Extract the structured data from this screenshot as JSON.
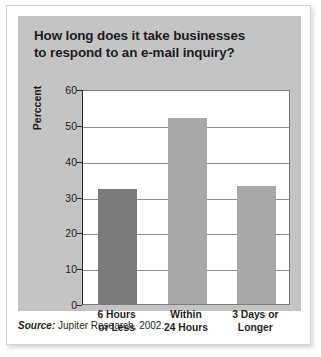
{
  "figure": {
    "title_line1": "How long does it take businesses",
    "title_line2": "to respond to an e-mail inquiry?",
    "source_label": "Source:",
    "source_text": " Jupiter Research, 2002."
  },
  "colors": {
    "panel_background": "#c4c4c4",
    "plot_background": "#ffffff",
    "card_background": "#ffffff",
    "gridline": "#8e8e8e",
    "axis": "#2b2b2b",
    "text": "#1f1f1f",
    "bar_dark": "#7b7b7b",
    "bar_light": "#a8a8a8"
  },
  "chart_data": {
    "type": "bar",
    "title": "How long does it take businesses to respond to an e-mail inquiry?",
    "xlabel": "",
    "ylabel": "Perccent",
    "categories": [
      "6 Hours or Less",
      "Within 24 Hours",
      "3 Days or Longer"
    ],
    "category_lines": [
      [
        "6 Hours",
        "or Less"
      ],
      [
        "Within",
        "24 Hours"
      ],
      [
        "3 Days or",
        "Longer"
      ]
    ],
    "values": [
      32,
      52,
      33
    ],
    "bar_colors": [
      "#7b7b7b",
      "#a8a8a8",
      "#a8a8a8"
    ],
    "ylim": [
      0,
      60
    ],
    "yticks": [
      0,
      10,
      20,
      30,
      40,
      50,
      60
    ],
    "ytick_labels": [
      "0",
      "10",
      "20",
      "30",
      "40",
      "50",
      "60"
    ],
    "grid": true,
    "legend": false,
    "source": "Source: Jupiter Research, 2002."
  }
}
